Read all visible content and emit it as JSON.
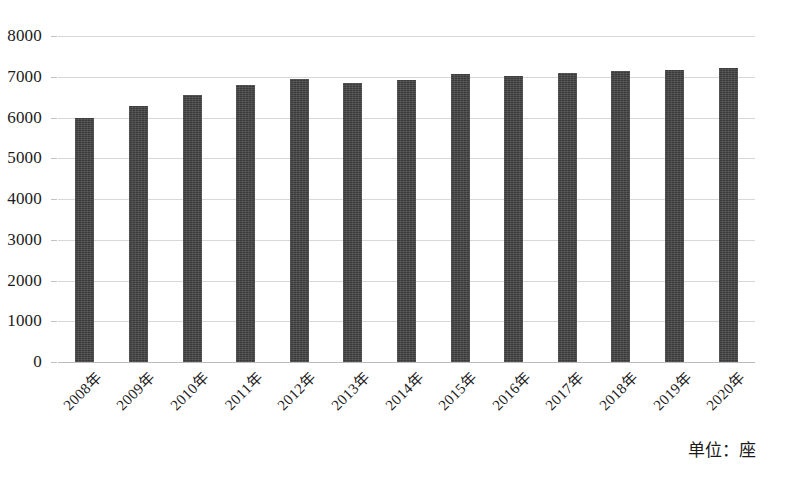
{
  "chart_data": {
    "type": "bar",
    "title": "",
    "subtitle": "",
    "xlabel": "",
    "ylabel": "",
    "unit_caption": "单位：座",
    "categories": [
      "2008年",
      "2009年",
      "2010年",
      "2011年",
      "2012年",
      "2013年",
      "2014年",
      "2015年",
      "2016年",
      "2017年",
      "2018年",
      "2019年",
      "2020年"
    ],
    "values": [
      5990,
      6290,
      6560,
      6800,
      6950,
      6840,
      6920,
      7060,
      7020,
      7090,
      7140,
      7170,
      7220
    ],
    "series": [
      {
        "name": "座数",
        "values": [
          5990,
          6290,
          6560,
          6800,
          6950,
          6840,
          6920,
          7060,
          7020,
          7090,
          7140,
          7170,
          7220
        ]
      }
    ],
    "ylim": [
      0,
      8000
    ],
    "ytick_values": [
      8000,
      7000,
      6000,
      5000,
      4000,
      3000,
      2000,
      1000,
      0
    ],
    "ytick_labels": [
      "8000",
      "7000",
      "6000",
      "5000",
      "4000",
      "3000",
      "2000",
      "1000",
      "0"
    ],
    "grid": true,
    "grid_axis": "y",
    "legend": false,
    "legend_position": "none",
    "bar_color": "#3b3b3b",
    "gridline_color": "#d7d7d7",
    "background_color": "#ffffff",
    "xtick_rotation": -45
  }
}
